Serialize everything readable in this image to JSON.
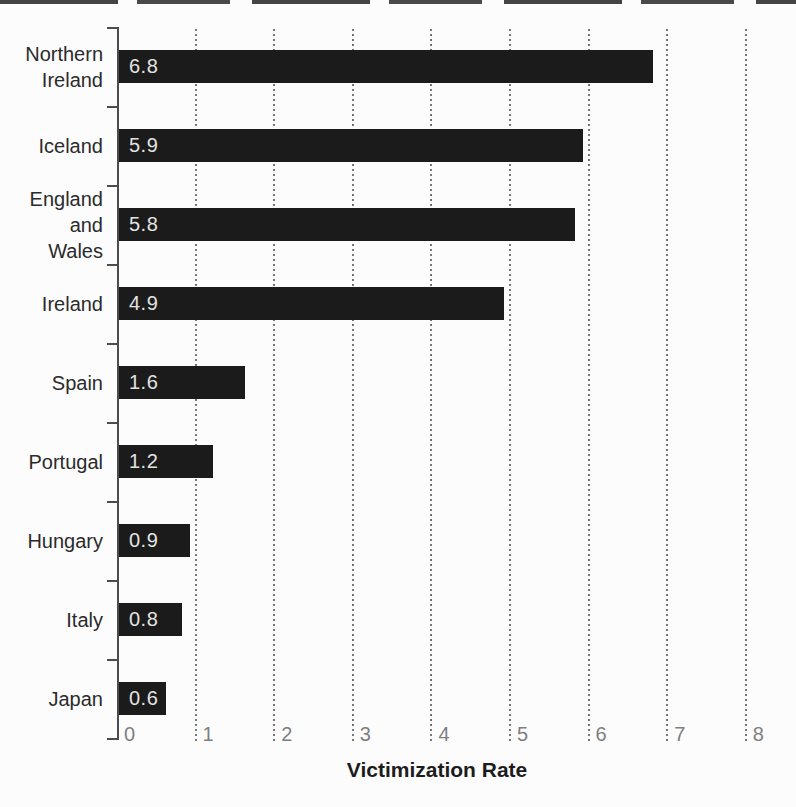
{
  "chart_data": {
    "type": "bar",
    "orientation": "horizontal",
    "title": "",
    "xlabel": "Victimization Rate",
    "ylabel": "",
    "xlim": [
      0,
      8
    ],
    "x_ticks": [
      "0",
      "1",
      "2",
      "3",
      "4",
      "5",
      "6",
      "7",
      "8"
    ],
    "grid": "dotted vertical gridlines at each integer",
    "legend": null,
    "categories": [
      "Northern Ireland",
      "Iceland",
      "England and Wales",
      "Ireland",
      "Spain",
      "Portugal",
      "Hungary",
      "Italy",
      "Japan"
    ],
    "label_lines": [
      [
        "Northern",
        "Ireland"
      ],
      [
        "Iceland"
      ],
      [
        "England",
        "and",
        "Wales"
      ],
      [
        "Ireland"
      ],
      [
        "Spain"
      ],
      [
        "Portugal"
      ],
      [
        "Hungary"
      ],
      [
        "Italy"
      ],
      [
        "Japan"
      ]
    ],
    "values": [
      6.8,
      5.9,
      5.8,
      4.9,
      1.6,
      1.2,
      0.9,
      0.8,
      0.6
    ],
    "value_labels": [
      "6.8",
      "5.9",
      "5.8",
      "4.9",
      "1.6",
      "1.2",
      "0.9",
      "0.8",
      "0.6"
    ]
  },
  "colors": {
    "bar": "#1b1b1b",
    "bar_value_label": "#e3e3e3",
    "category_label": "#2b2b2b",
    "axis": "#4c4c4c",
    "grid_dot": "#767676",
    "tick_label": "#7f7f7f",
    "xlabel": "#1c1c1c",
    "background": "#fcfcfc"
  }
}
